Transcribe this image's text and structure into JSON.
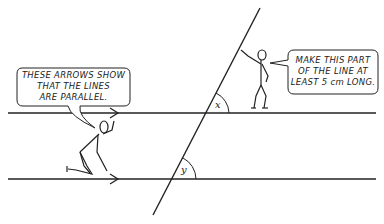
{
  "diagram": {
    "type": "parallel-lines-transversal",
    "left_bubble": {
      "lines": [
        "THESE ARROWS SHOW",
        "THAT THE LINES",
        "ARE PARALLEL."
      ]
    },
    "right_bubble": {
      "lines": [
        "MAKE THIS PART",
        "OF THE LINE AT",
        "LEAST 5 cm LONG."
      ]
    },
    "angles": {
      "upper": "x",
      "lower": "y"
    },
    "colors": {
      "line": "#222222",
      "background": "#ffffff"
    }
  }
}
